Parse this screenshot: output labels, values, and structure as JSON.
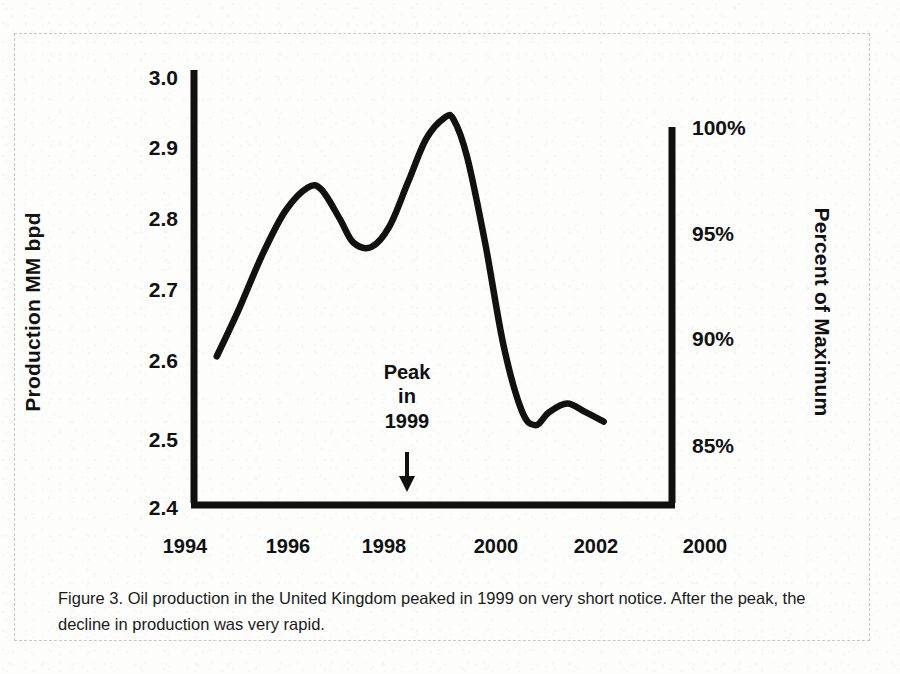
{
  "figure": {
    "caption": "Figure 3.  Oil production in the United Kingdom peaked in 1999 on very short notice.  After the peak, the decline in production was very rapid.",
    "annotation": {
      "line1": "Peak",
      "line2": "in",
      "line3": "1999",
      "arrow": "down-arrow"
    },
    "ink_color": "#111111",
    "paper_color": "#fdfdfc"
  },
  "chart_data": {
    "type": "line",
    "title": "",
    "subtitle": "",
    "xlabel": "",
    "ylabel": "Production MM bpd",
    "y2label": "Percent of Maximum",
    "grid": false,
    "legend": null,
    "xlim": [
      1993.5,
      2004.0
    ],
    "ylim": [
      2.4,
      3.0
    ],
    "y2lim": [
      82.0,
      102.3
    ],
    "xticks": [
      "1994",
      "1996",
      "1998",
      "2000",
      "2002",
      "2000"
    ],
    "xtick_values": [
      1994,
      1996,
      1998,
      2000,
      2002,
      2004
    ],
    "yticks": [
      "2.4",
      "2.5",
      "2.6",
      "2.7",
      "2.8",
      "2.9",
      "3.0"
    ],
    "ytick_values": [
      2.4,
      2.5,
      2.6,
      2.7,
      2.8,
      2.9,
      3.0
    ],
    "y2ticks": [
      "85%",
      "90%",
      "95%",
      "100%"
    ],
    "y2tick_values": [
      85,
      90,
      95,
      100
    ],
    "series": [
      {
        "name": "UK oil production",
        "x": [
          1994.0,
          1994.5,
          1995.0,
          1995.5,
          1996.0,
          1996.3,
          1996.7,
          1997.0,
          1997.4,
          1997.8,
          1998.2,
          1998.6,
          1999.0,
          1999.2,
          1999.5,
          1999.9,
          2000.3,
          2000.7,
          2001.0,
          2001.3,
          2001.7,
          2002.1,
          2002.5
        ],
        "y": [
          2.605,
          2.672,
          2.745,
          2.805,
          2.838,
          2.835,
          2.795,
          2.762,
          2.756,
          2.785,
          2.845,
          2.905,
          2.934,
          2.932,
          2.88,
          2.76,
          2.62,
          2.53,
          2.51,
          2.528,
          2.54,
          2.528,
          2.515
        ]
      }
    ],
    "annotations": [
      {
        "text": "Peak in 1999",
        "x": 1999.0,
        "note": "arrow points to x-axis below the 1999 peak"
      }
    ]
  },
  "axes": {
    "left_title": "Production MM bpd",
    "right_title": "Percent of Maximum"
  }
}
